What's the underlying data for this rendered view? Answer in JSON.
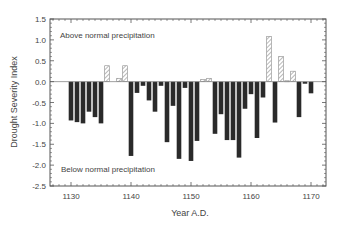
{
  "chart_data": {
    "type": "bar",
    "title": "",
    "xlabel": "Year A.D.",
    "ylabel": "Drought Severity Index",
    "xlim": [
      1126.5,
      1172.5
    ],
    "ylim": [
      -2.5,
      1.5
    ],
    "xticks": [
      1130,
      1140,
      1150,
      1160,
      1170
    ],
    "yticks": [
      1.5,
      1.0,
      0.5,
      0.0,
      -0.5,
      -1.0,
      -1.5,
      -2.0,
      -2.5
    ],
    "ytick_labels": [
      "1.5",
      "1.0",
      "0.5",
      "0.0",
      "-0.5",
      "-1.0",
      "-1.5",
      "-2.0",
      "-2.5"
    ],
    "grid": false,
    "annotations": [
      {
        "text": "Above normal precipitation",
        "x": 1131,
        "y": 1.1
      },
      {
        "text": "Below normal precipitation",
        "x": 1131,
        "y": -2.05
      }
    ],
    "legend": "none",
    "positive_style": "hatched",
    "negative_style": "solid-dark",
    "x": [
      1130,
      1131,
      1132,
      1133,
      1134,
      1135,
      1136,
      1137,
      1138,
      1139,
      1140,
      1141,
      1142,
      1143,
      1144,
      1145,
      1146,
      1147,
      1148,
      1149,
      1150,
      1151,
      1152,
      1153,
      1154,
      1155,
      1156,
      1157,
      1158,
      1159,
      1160,
      1161,
      1162,
      1163,
      1164,
      1165,
      1166,
      1167,
      1168,
      1169,
      1170
    ],
    "values": [
      -0.93,
      -0.97,
      -1.0,
      -0.72,
      -0.85,
      -1.0,
      0.38,
      0.0,
      0.08,
      0.38,
      -1.78,
      -0.27,
      -0.1,
      -0.45,
      -0.72,
      -0.1,
      -1.45,
      -0.58,
      -1.85,
      -0.15,
      -1.9,
      -1.42,
      0.05,
      0.08,
      -1.25,
      -0.78,
      -1.4,
      -1.4,
      -1.82,
      -0.65,
      -0.3,
      -1.35,
      -0.38,
      1.08,
      -0.98,
      0.6,
      0.02,
      0.25,
      -0.85,
      -0.05,
      -0.28
    ]
  },
  "colors": {
    "negative_bar": "#2a2a2a",
    "positive_hatch": "#8a8a8a",
    "axis": "#555555",
    "text": "#444444"
  }
}
